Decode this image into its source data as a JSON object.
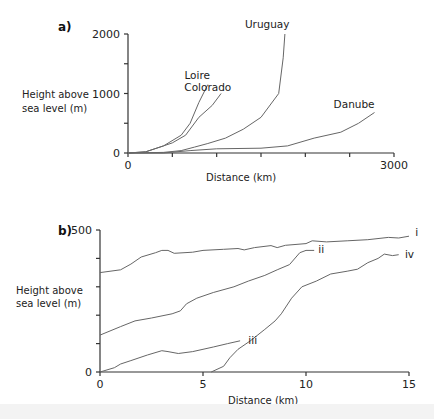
{
  "chart_data": [
    {
      "panel": "a)",
      "type": "line",
      "title": "",
      "xlabel": "Distance (km)",
      "ylabel": "Height above sea level (m)",
      "xlim": [
        0,
        3000
      ],
      "ylim": [
        0,
        2000
      ],
      "x_tick_labels": [
        "0",
        "3000"
      ],
      "x_ticks": [
        0,
        500,
        1000,
        1500,
        2000,
        2500,
        3000
      ],
      "y_tick_labels": [
        "0",
        "1000",
        "2000"
      ],
      "y_ticks": [
        0,
        500,
        1000,
        1500,
        2000
      ],
      "grid": false,
      "legend": "inline labels",
      "series": [
        {
          "name": "Loire",
          "points": [
            [
              0,
              0
            ],
            [
              200,
              20
            ],
            [
              400,
              120
            ],
            [
              600,
              300
            ],
            [
              700,
              500
            ],
            [
              800,
              850
            ],
            [
              900,
              1150
            ]
          ]
        },
        {
          "name": "Colorado",
          "points": [
            [
              0,
              0
            ],
            [
              200,
              20
            ],
            [
              400,
              120
            ],
            [
              500,
              170
            ],
            [
              650,
              300
            ],
            [
              800,
              600
            ],
            [
              950,
              800
            ],
            [
              1050,
              1000
            ]
          ]
        },
        {
          "name": "Uruguay",
          "points": [
            [
              0,
              0
            ],
            [
              400,
              10
            ],
            [
              600,
              40
            ],
            [
              750,
              100
            ],
            [
              900,
              160
            ],
            [
              1100,
              250
            ],
            [
              1300,
              400
            ],
            [
              1500,
              600
            ],
            [
              1700,
              1000
            ],
            [
              1750,
              1600
            ],
            [
              1770,
              2000
            ]
          ]
        },
        {
          "name": "Danube",
          "points": [
            [
              0,
              0
            ],
            [
              400,
              0
            ],
            [
              700,
              40
            ],
            [
              1000,
              70
            ],
            [
              1500,
              80
            ],
            [
              1800,
              120
            ],
            [
              2100,
              250
            ],
            [
              2400,
              350
            ],
            [
              2600,
              500
            ],
            [
              2780,
              680
            ]
          ]
        }
      ],
      "labels": [
        {
          "text": "Loire",
          "x": 780,
          "y": 1250
        },
        {
          "text": "Colorado",
          "x": 900,
          "y": 1050
        },
        {
          "text": "Uruguay",
          "x": 1570,
          "y": 2100
        },
        {
          "text": "Danube",
          "x": 2550,
          "y": 750
        }
      ]
    },
    {
      "panel": "b)",
      "type": "line",
      "title": "",
      "xlabel": "Distance (km)",
      "ylabel": "Height above sea level (m)",
      "xlim": [
        0,
        15
      ],
      "ylim": [
        0,
        500
      ],
      "x_tick_labels": [
        "0",
        "5",
        "10",
        "15"
      ],
      "x_ticks": [
        0,
        5,
        10,
        15
      ],
      "y_tick_labels": [
        "0",
        "500"
      ],
      "y_ticks": [
        0,
        100,
        200,
        300,
        400,
        500
      ],
      "grid": false,
      "legend": "inline labels",
      "series": [
        {
          "name": "i",
          "points": [
            [
              0,
              350
            ],
            [
              1,
              360
            ],
            [
              1.5,
              380
            ],
            [
              2,
              405
            ],
            [
              2.7,
              420
            ],
            [
              3,
              428
            ],
            [
              3.3,
              428
            ],
            [
              3.6,
              418
            ],
            [
              4.5,
              422
            ],
            [
              5,
              428
            ],
            [
              6,
              432
            ],
            [
              6.7,
              435
            ],
            [
              7,
              430
            ],
            [
              7.5,
              438
            ],
            [
              8.3,
              445
            ],
            [
              8.6,
              438
            ],
            [
              9,
              446
            ],
            [
              10,
              452
            ],
            [
              10.3,
              462
            ],
            [
              11,
              458
            ],
            [
              12,
              462
            ],
            [
              13,
              466
            ],
            [
              14,
              474
            ],
            [
              14.5,
              472
            ],
            [
              15,
              478
            ]
          ]
        },
        {
          "name": "ii",
          "points": [
            [
              0,
              130
            ],
            [
              1,
              160
            ],
            [
              1.7,
              180
            ],
            [
              2.5,
              190
            ],
            [
              3.5,
              205
            ],
            [
              3.9,
              215
            ],
            [
              4.2,
              240
            ],
            [
              4.7,
              260
            ],
            [
              5.5,
              280
            ],
            [
              6.5,
              300
            ],
            [
              7.2,
              320
            ],
            [
              8,
              340
            ],
            [
              8.6,
              360
            ],
            [
              9.2,
              378
            ],
            [
              9.7,
              420
            ],
            [
              10,
              428
            ],
            [
              10.4,
              428
            ]
          ]
        },
        {
          "name": "iii",
          "points": [
            [
              0,
              0
            ],
            [
              0.7,
              15
            ],
            [
              1,
              28
            ],
            [
              1.5,
              40
            ],
            [
              2.3,
              60
            ],
            [
              3,
              75
            ],
            [
              3.3,
              72
            ],
            [
              3.8,
              65
            ],
            [
              4.5,
              72
            ],
            [
              5,
              80
            ],
            [
              5.5,
              88
            ],
            [
              6.2,
              100
            ],
            [
              6.8,
              110
            ]
          ]
        },
        {
          "name": "iv",
          "points": [
            [
              5.4,
              0
            ],
            [
              6,
              20
            ],
            [
              6.3,
              50
            ],
            [
              6.7,
              80
            ],
            [
              7.3,
              110
            ],
            [
              8,
              150
            ],
            [
              8.5,
              180
            ],
            [
              8.8,
              205
            ],
            [
              9.3,
              260
            ],
            [
              9.8,
              300
            ],
            [
              10.5,
              320
            ],
            [
              11.2,
              345
            ],
            [
              12,
              355
            ],
            [
              12.5,
              362
            ],
            [
              13,
              385
            ],
            [
              13.5,
              400
            ],
            [
              13.8,
              415
            ],
            [
              14.2,
              410
            ],
            [
              14.5,
              413
            ]
          ]
        }
      ],
      "labels": [
        {
          "text": "i",
          "x": 15.3,
          "y": 478
        },
        {
          "text": "ii",
          "x": 10.6,
          "y": 418
        },
        {
          "text": "iii",
          "x": 7.2,
          "y": 100
        },
        {
          "text": "iv",
          "x": 14.8,
          "y": 400
        }
      ]
    }
  ],
  "panels": {
    "a": {
      "label": "a)",
      "ylabel_line1": "Height above",
      "ylabel_line2": "sea level (m)",
      "xlabel": "Distance (km)"
    },
    "b": {
      "label": "b)",
      "ylabel_line1": "Height above",
      "ylabel_line2": "sea level (m)",
      "xlabel": "Distance (km)"
    }
  }
}
